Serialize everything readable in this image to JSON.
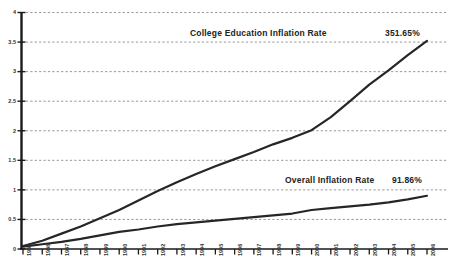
{
  "chart_data": {
    "type": "line",
    "title": "",
    "xlabel": "",
    "ylabel": "",
    "grid": true,
    "legend_position": "inline-annotation",
    "ylim": [
      0,
      4
    ],
    "yticks": [
      "0",
      "0.5",
      "1",
      "1.5",
      "2",
      "2.5",
      "3",
      "3.5",
      "4"
    ],
    "ytick_values": [
      0,
      0.5,
      1,
      1.5,
      2,
      2.5,
      3,
      3.5,
      4
    ],
    "categories": [
      "1985",
      "1986",
      "1987",
      "1988",
      "1989",
      "1990",
      "1991",
      "1992",
      "1993",
      "1994",
      "1995",
      "1996",
      "1997",
      "1998",
      "1999",
      "2000",
      "2001",
      "2002",
      "2003",
      "2004",
      "2005",
      "2006"
    ],
    "series": [
      {
        "name": "College Education Inflation Rate",
        "end_label": "351.65%",
        "color": "#262626",
        "values": [
          0.05,
          0.14,
          0.26,
          0.38,
          0.52,
          0.66,
          0.82,
          0.98,
          1.13,
          1.27,
          1.4,
          1.52,
          1.64,
          1.77,
          1.88,
          2.01,
          2.23,
          2.5,
          2.78,
          3.02,
          3.28,
          3.52
        ]
      },
      {
        "name": "Overall Inflation Rate",
        "end_label": "91.86%",
        "color": "#262626",
        "values": [
          0.04,
          0.08,
          0.12,
          0.17,
          0.23,
          0.29,
          0.33,
          0.38,
          0.42,
          0.45,
          0.48,
          0.51,
          0.54,
          0.57,
          0.6,
          0.66,
          0.69,
          0.72,
          0.75,
          0.79,
          0.84,
          0.9
        ]
      }
    ]
  },
  "annotations": {
    "college_label": "College Education Inflation Rate",
    "college_value": "351.65%",
    "overall_label": "Overall Inflation Rate",
    "overall_value": "91.86%"
  },
  "style": {
    "background": "#ffffff",
    "line_color": "#262626",
    "axis_color": "#1a1a1a",
    "grid_color": "#8a8a8a"
  }
}
